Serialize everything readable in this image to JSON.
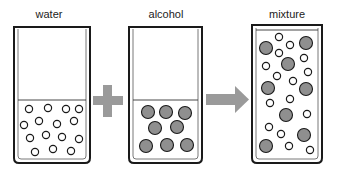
{
  "diagram": {
    "colors": {
      "outline": "#1a1a1a",
      "water_particle_fill": "#ffffff",
      "alcohol_particle_fill": "#8f8f8f",
      "operator": "#9a9a9a"
    },
    "beakers": [
      {
        "id": "water",
        "label": "water",
        "particle_type": "water",
        "particle_count": 15
      },
      {
        "id": "alcohol",
        "label": "alcohol",
        "particle_type": "alcohol",
        "particle_count": 8
      },
      {
        "id": "mixture",
        "label": "mixture",
        "particle_type": "mixed",
        "particle_count": 29
      }
    ],
    "operators": [
      {
        "id": "plus",
        "symbol": "plus",
        "meaning": "add"
      },
      {
        "id": "arrow",
        "symbol": "right-arrow",
        "meaning": "yields"
      }
    ]
  }
}
